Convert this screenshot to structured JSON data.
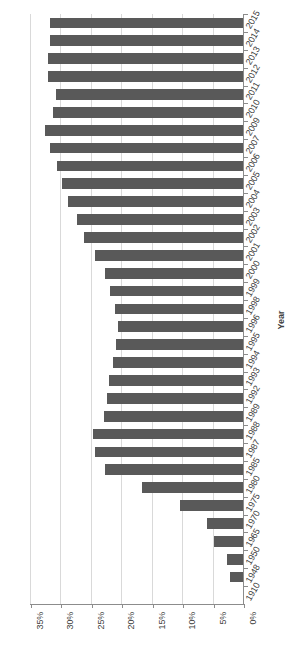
{
  "chart": {
    "type": "bar",
    "title": "",
    "bar_color": "#595959",
    "grid_color": "#d9d9d9",
    "axis_color": "#8c8c8c"
  },
  "axes": {
    "value_axis": {
      "label": "",
      "ticks": [
        "35%",
        "30%",
        "25%",
        "20%",
        "15%",
        "10%",
        "5%",
        "0%"
      ],
      "min": 0,
      "max": 35,
      "orientation": "horizontal-reversed"
    },
    "category_axis": {
      "title": "Year",
      "orientation": "vertical"
    }
  },
  "chart_data": {
    "type": "bar",
    "title": "",
    "xlabel": "",
    "ylabel": "Year",
    "orientation": "horizontal",
    "xlim": [
      0,
      35
    ],
    "x_reversed": true,
    "grid": true,
    "legend": false,
    "value_format": "percent",
    "categories": [
      "2015",
      "2014",
      "2013",
      "2012",
      "2011",
      "2010",
      "2009",
      "2007",
      "2006",
      "2005",
      "2004",
      "2003",
      "2002",
      "2001",
      "2000",
      "1999",
      "1998",
      "1996",
      "1995",
      "1994",
      "1993",
      "1992",
      "1989",
      "1988",
      "1987",
      "1985",
      "1980",
      "1975",
      "1970",
      "1965",
      "1950",
      "1948",
      "1910"
    ],
    "values": [
      31.7,
      31.7,
      32.0,
      32.0,
      30.8,
      31.2,
      32.6,
      31.7,
      30.5,
      29.7,
      28.8,
      27.2,
      26.1,
      24.3,
      22.6,
      21.8,
      21.0,
      20.5,
      20.8,
      21.3,
      22.0,
      22.4,
      22.8,
      24.7,
      24.3,
      22.7,
      16.6,
      10.4,
      5.9,
      4.8,
      2.7,
      2.2,
      0.0
    ],
    "xtick_labels": [
      "35%",
      "30%",
      "25%",
      "20%",
      "15%",
      "10%",
      "5%",
      "0%"
    ],
    "xtick_values": [
      35,
      30,
      25,
      20,
      15,
      10,
      5,
      0
    ]
  }
}
